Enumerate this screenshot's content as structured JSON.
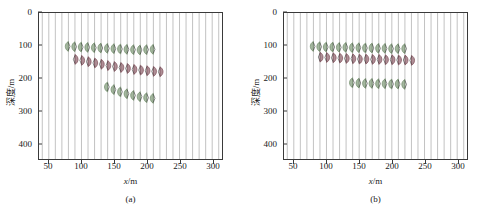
{
  "figure": {
    "panels": [
      {
        "id": "a",
        "caption": "(a)",
        "xlabel_var": "x",
        "xlabel_unit": "/m",
        "ylabel": "深度/m",
        "xticks": [
          50,
          100,
          150,
          200,
          250,
          300
        ],
        "yticks": [
          0,
          100,
          200,
          300,
          400
        ]
      },
      {
        "id": "b",
        "caption": "(b)",
        "xlabel_var": "x",
        "xlabel_unit": "/m",
        "ylabel": "深度/m",
        "xticks": [
          50,
          100,
          150,
          200,
          250,
          300
        ],
        "yticks": [
          0,
          100,
          200,
          300,
          400
        ]
      }
    ]
  },
  "chart_data": [
    {
      "type": "line",
      "panel": "a",
      "title": "",
      "subtitle": "(a)",
      "xlabel": "x/m",
      "ylabel": "深度/m",
      "xlim": [
        35,
        315
      ],
      "ylim": [
        0,
        450
      ],
      "y_inverted": true,
      "grid": true,
      "grid_axis": "x",
      "trace_x_positions": [
        40,
        50,
        60,
        70,
        80,
        90,
        100,
        110,
        120,
        130,
        140,
        150,
        160,
        170,
        180,
        190,
        200,
        210,
        220,
        230,
        240,
        250,
        260,
        270,
        280,
        290,
        300,
        310
      ],
      "trace_spacing_m": 10,
      "legend": "none",
      "colors": {
        "event_green": "#6d8a66",
        "event_maroon": "#7d4a55",
        "trace_line": "#8e8e8e",
        "axis": "#3a3a3a"
      },
      "events": [
        {
          "name": "event-1-upper-green",
          "polarity": "negative",
          "color": "#6d8a66",
          "x": [
            80,
            90,
            100,
            110,
            120,
            130,
            140,
            150,
            160,
            170,
            180,
            190,
            200,
            210
          ],
          "depth": [
            103,
            104,
            105,
            106,
            107,
            108,
            109,
            110,
            111,
            112,
            113,
            114,
            113,
            112
          ]
        },
        {
          "name": "event-2-middle-maroon",
          "polarity": "positive",
          "color": "#7d4a55",
          "x": [
            90,
            100,
            110,
            120,
            130,
            140,
            150,
            160,
            170,
            180,
            190,
            200,
            210,
            220
          ],
          "depth": [
            143,
            146,
            150,
            154,
            158,
            162,
            165,
            168,
            171,
            174,
            176,
            178,
            180,
            181
          ]
        },
        {
          "name": "event-3-lower-green",
          "polarity": "negative",
          "color": "#6d8a66",
          "x": [
            140,
            150,
            160,
            170,
            180,
            190,
            200,
            210
          ],
          "depth": [
            228,
            236,
            243,
            249,
            254,
            258,
            261,
            263
          ]
        }
      ]
    },
    {
      "type": "line",
      "panel": "b",
      "title": "",
      "subtitle": "(b)",
      "xlabel": "x/m",
      "ylabel": "深度/m",
      "xlim": [
        35,
        315
      ],
      "ylim": [
        0,
        450
      ],
      "y_inverted": true,
      "grid": true,
      "grid_axis": "x",
      "trace_x_positions": [
        40,
        50,
        60,
        70,
        80,
        90,
        100,
        110,
        120,
        130,
        140,
        150,
        160,
        170,
        180,
        190,
        200,
        210,
        220,
        230,
        240,
        250,
        260,
        270,
        280,
        290,
        300,
        310
      ],
      "trace_spacing_m": 10,
      "legend": "none",
      "colors": {
        "event_green": "#6d8a66",
        "event_maroon": "#7d4a55",
        "trace_line": "#8e8e8e",
        "axis": "#3a3a3a"
      },
      "events": [
        {
          "name": "event-1-upper-green",
          "polarity": "negative",
          "color": "#6d8a66",
          "x": [
            80,
            90,
            100,
            110,
            120,
            130,
            140,
            150,
            160,
            170,
            180,
            190,
            200,
            210,
            220
          ],
          "depth": [
            103,
            104,
            105,
            105,
            106,
            106,
            107,
            107,
            108,
            108,
            109,
            109,
            110,
            110,
            110
          ]
        },
        {
          "name": "event-2-middle-maroon",
          "polarity": "positive",
          "color": "#7d4a55",
          "x": [
            90,
            100,
            110,
            120,
            130,
            140,
            150,
            160,
            170,
            180,
            190,
            200,
            210,
            220,
            230
          ],
          "depth": [
            136,
            137,
            138,
            139,
            140,
            141,
            142,
            142,
            143,
            143,
            144,
            144,
            145,
            145,
            146
          ]
        },
        {
          "name": "event-3-lower-green",
          "polarity": "negative",
          "color": "#6d8a66",
          "x": [
            140,
            150,
            160,
            170,
            180,
            190,
            200,
            210,
            220
          ],
          "depth": [
            215,
            216,
            217,
            217,
            218,
            218,
            219,
            219,
            220
          ]
        }
      ]
    }
  ]
}
